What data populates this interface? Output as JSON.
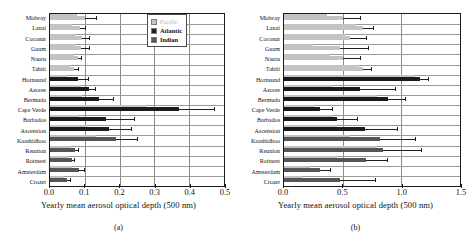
{
  "figure": {
    "axis_title": "Yearly mean aerosol optical depth (500 nm)",
    "panel_a_label": "(a)",
    "panel_b_label": "(b)",
    "colors": {
      "pacific": "#c3c3c3",
      "atlantic": "#1a1a1a",
      "indian": "#555555",
      "axis": "#1a1a1a",
      "grid": "#8d8d8d"
    },
    "legend": [
      {
        "label": "Pacific",
        "color": "#c3c3c3"
      },
      {
        "label": "Atlantic",
        "color": "#1f1f1f"
      },
      {
        "label": "Indian",
        "color": "#565656"
      }
    ]
  },
  "chart_data": [
    {
      "type": "bar",
      "orientation": "horizontal",
      "panel": "(a)",
      "title": "",
      "xlabel": "Yearly mean aerosol optical depth (500 nm)",
      "ylabel": "",
      "xlim": [
        0.0,
        0.5
      ],
      "xticks": [
        "0.0",
        "0.1",
        "0.2",
        "0.3",
        "0.4",
        "0.5"
      ],
      "xtick_values": [
        0.0,
        0.1,
        0.2,
        0.3,
        0.4,
        0.5
      ],
      "grid": true,
      "legend_position": "top-right",
      "categories": [
        "Midway",
        "Lanai",
        "Coconut",
        "Guam",
        "Nauru",
        "Tahiti",
        "Hornsund",
        "Azores",
        "Bermuda",
        "Cape Verde",
        "Barbados",
        "Ascension",
        "Kaashidhoo",
        "Reunion",
        "Rottnest",
        "Amsterdam",
        "Crozet"
      ],
      "groups": [
        "Pacific",
        "Pacific",
        "Pacific",
        "Pacific",
        "Pacific",
        "Pacific",
        "Atlantic",
        "Atlantic",
        "Atlantic",
        "Atlantic",
        "Atlantic",
        "Atlantic",
        "Indian",
        "Indian",
        "Indian",
        "Indian",
        "Indian"
      ],
      "series": [
        {
          "name": "range-extent",
          "color": "#c3c3c3",
          "values": [
            0.078,
            0.062,
            0.072,
            0.072,
            0.07,
            0.058,
            0.05,
            0.09,
            0.092,
            0.275,
            0.082,
            0.105,
            0.132,
            0.06,
            0.052,
            0.064,
            0.04
          ]
        },
        {
          "name": "mean",
          "color": "#333333",
          "values": [
            0.1,
            0.086,
            0.092,
            0.09,
            0.08,
            0.068,
            0.08,
            0.112,
            0.14,
            0.37,
            0.16,
            0.17,
            0.19,
            0.072,
            0.062,
            0.082,
            0.05
          ]
        }
      ],
      "error_upper": [
        0.132,
        0.1,
        0.112,
        0.112,
        0.088,
        0.08,
        0.11,
        0.13,
        0.182,
        0.472,
        0.242,
        0.232,
        0.25,
        0.08,
        0.07,
        0.098,
        0.058
      ]
    },
    {
      "type": "bar",
      "orientation": "horizontal",
      "panel": "(b)",
      "title": "",
      "xlabel": "Yearly mean aerosol optical depth (500 nm)",
      "ylabel": "",
      "xlim": [
        0.0,
        1.5
      ],
      "xticks": [
        "0.0",
        "0.5",
        "1.0",
        "1.5"
      ],
      "xtick_values": [
        0.0,
        0.5,
        1.0,
        1.5
      ],
      "grid": true,
      "legend_position": "top-right",
      "categories": [
        "Midway",
        "Lanai",
        "Coconut",
        "Guam",
        "Nauru",
        "Tahiti",
        "Hornsund",
        "Azores",
        "Bermuda",
        "Cape Verde",
        "Barbados",
        "Ascension",
        "Kaashidhoo",
        "Reunion",
        "Rottnest",
        "Amsterdam",
        "Crozet"
      ],
      "groups": [
        "Pacific",
        "Pacific",
        "Pacific",
        "Pacific",
        "Pacific",
        "Pacific",
        "Atlantic",
        "Atlantic",
        "Atlantic",
        "Atlantic",
        "Atlantic",
        "Atlantic",
        "Indian",
        "Indian",
        "Indian",
        "Indian",
        "Indian"
      ],
      "series": [
        {
          "name": "range-extent",
          "color": "#c3c3c3",
          "values": [
            0.37,
            0.615,
            0.52,
            0.25,
            0.39,
            0.64,
            1.12,
            0.405,
            0.79,
            0.255,
            0.42,
            0.45,
            0.56,
            0.79,
            0.455,
            0.225,
            0.15
          ]
        },
        {
          "name": "mean",
          "color": "#333333",
          "values": [
            0.5,
            0.675,
            0.56,
            0.48,
            0.505,
            0.67,
            1.155,
            0.65,
            0.89,
            0.305,
            0.45,
            0.69,
            0.82,
            0.84,
            0.695,
            0.31,
            0.48
          ]
        }
      ],
      "error_upper": [
        0.65,
        0.76,
        0.7,
        0.715,
        0.65,
        0.745,
        1.23,
        0.95,
        1.03,
        0.405,
        0.62,
        0.96,
        1.115,
        1.17,
        0.88,
        0.39,
        0.775
      ]
    }
  ]
}
